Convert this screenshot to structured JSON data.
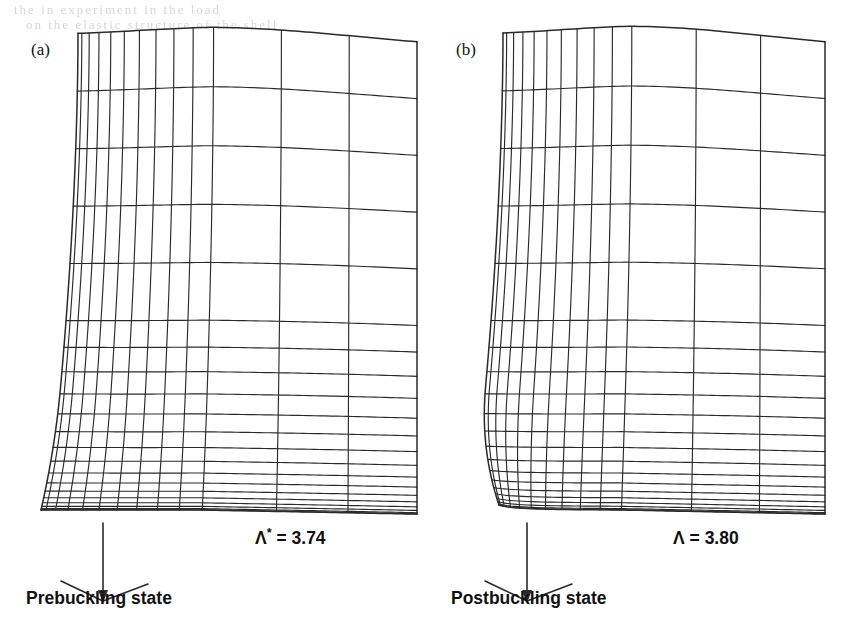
{
  "figure": {
    "type": "fem-mesh-deformation-comparison",
    "background": "#ffffff",
    "line_color": "#2a2a2a",
    "ghost_text": {
      "line1": "the     in     experiment     in     the     load",
      "line2": "on     the     elastic     structure     of     the     shell"
    }
  },
  "panels": [
    {
      "id": "a",
      "tag": "(a)",
      "lambda_symbol": "Λ",
      "lambda_superscript": "*",
      "lambda_equals": " = ",
      "lambda_value": "3.74",
      "caption": "Prebuckling state",
      "mesh": {
        "x_left": 78,
        "x_right": 417,
        "y_top": 38,
        "y_bottom": 510,
        "dense_columns": 10,
        "wide_columns": 3,
        "coarse_rows": 5,
        "graded_rows": 16,
        "corner_style": "smooth-flare",
        "ridge_peak_x": 210,
        "ridge_rise": 12
      }
    },
    {
      "id": "b",
      "tag": "(b)",
      "lambda_symbol": "Λ",
      "lambda_superscript": "",
      "lambda_equals": " = ",
      "lambda_value": "3.80",
      "caption": "Postbuckling state",
      "mesh": {
        "x_left": 74,
        "x_right": 396,
        "y_top": 38,
        "y_bottom": 510,
        "dense_columns": 10,
        "wide_columns": 3,
        "coarse_rows": 5,
        "graded_rows": 16,
        "corner_style": "sharp-pinch",
        "ridge_peak_x": 200,
        "ridge_rise": 13
      }
    }
  ],
  "axis_marker": {
    "name": "load-direction-triad",
    "arrow_direction": "down",
    "arrow_length": 78,
    "left_leg_dx": -42,
    "left_leg_dy": -20,
    "right_leg_dx": 45,
    "right_leg_dy": -17
  },
  "chart_data": {
    "type": "diagram",
    "series": [
      {
        "name": "Prebuckling state",
        "load_parameter": "Λ*",
        "value": 3.74
      },
      {
        "name": "Postbuckling state",
        "load_parameter": "Λ",
        "value": 3.8
      }
    ],
    "xlabel": "",
    "ylabel": "",
    "legend": [
      "(a) Prebuckling state",
      "(b) Postbuckling state"
    ]
  }
}
